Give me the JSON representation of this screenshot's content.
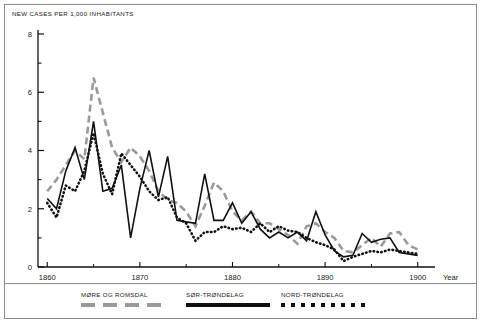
{
  "chart_data": {
    "type": "line",
    "title": "NEW CASES PER 1,000 INHABITANTS",
    "xlabel": "Year",
    "ylabel": "NEW CASES PER 1,000 INHABITANTS",
    "xlim": [
      1859,
      1901
    ],
    "ylim": [
      0,
      8
    ],
    "grid": false,
    "legend_position": "bottom",
    "ytick_labels": [
      "0",
      "2",
      "4",
      "6",
      "8"
    ],
    "ytick_values": [
      0,
      2,
      4,
      6,
      8
    ],
    "yminor_values": [
      1,
      3,
      5,
      7
    ],
    "xtick_labels": [
      "1860",
      "1870",
      "1880",
      "1890",
      "1900"
    ],
    "xtick_values": [
      1860,
      1870,
      1880,
      1890,
      1900
    ],
    "x": [
      1860,
      1861,
      1862,
      1863,
      1864,
      1865,
      1866,
      1867,
      1868,
      1869,
      1870,
      1871,
      1872,
      1873,
      1874,
      1875,
      1876,
      1877,
      1878,
      1879,
      1880,
      1881,
      1882,
      1883,
      1884,
      1885,
      1886,
      1887,
      1888,
      1889,
      1890,
      1891,
      1892,
      1893,
      1894,
      1895,
      1896,
      1897,
      1898,
      1899,
      1900
    ],
    "series": [
      {
        "name": "MØRE OG ROMSDAL",
        "style": "dashed",
        "color": "#9a9a9a",
        "values": [
          2.6,
          3.0,
          3.5,
          4.0,
          3.7,
          6.5,
          5.3,
          4.1,
          3.6,
          4.1,
          3.8,
          3.3,
          2.6,
          2.3,
          2.2,
          1.9,
          1.4,
          2.1,
          2.9,
          2.6,
          1.9,
          1.6,
          1.9,
          1.5,
          1.5,
          1.3,
          1.1,
          0.8,
          1.4,
          1.5,
          1.2,
          1.0,
          0.55,
          0.5,
          0.75,
          1.0,
          0.7,
          1.15,
          1.2,
          0.75,
          0.6
        ]
      },
      {
        "name": "SØR-TRØNDELAG",
        "style": "solid",
        "color": "#111111",
        "values": [
          2.35,
          2.0,
          3.3,
          4.1,
          3.0,
          5.0,
          2.6,
          2.7,
          3.5,
          1.0,
          2.7,
          4.0,
          2.4,
          3.8,
          1.6,
          1.55,
          1.5,
          3.2,
          1.6,
          1.6,
          2.2,
          1.5,
          1.9,
          1.3,
          1.0,
          1.2,
          1.0,
          1.2,
          0.9,
          1.9,
          1.1,
          0.55,
          0.35,
          0.4,
          1.15,
          0.85,
          0.95,
          1.0,
          0.5,
          0.45,
          0.4
        ]
      },
      {
        "name": "NORD-TRØNDELAG",
        "style": "dotted",
        "color": "#111111",
        "values": [
          2.2,
          1.7,
          2.8,
          2.6,
          3.3,
          4.6,
          3.2,
          2.5,
          3.9,
          3.5,
          3.1,
          2.6,
          2.3,
          2.4,
          1.7,
          1.5,
          0.9,
          1.2,
          1.2,
          1.4,
          1.3,
          1.35,
          1.2,
          1.5,
          1.2,
          1.4,
          1.25,
          1.2,
          1.0,
          0.85,
          0.75,
          0.6,
          0.2,
          0.35,
          0.45,
          0.55,
          0.5,
          0.6,
          0.55,
          0.5,
          0.45
        ]
      }
    ]
  },
  "legend": [
    {
      "label": "MØRE OG ROMSDAL",
      "style": "dashed"
    },
    {
      "label": "SØR-TRØNDELAG",
      "style": "solid"
    },
    {
      "label": "NORD-TRØNDELAG",
      "style": "dotted"
    }
  ],
  "colors": {
    "more_og_romsdal": "#9a9a9a",
    "sor_trondelag": "#111111",
    "nord_trondelag": "#111111",
    "axis": "#111111",
    "frame": "#8d8d8d",
    "background": "#ffffff"
  }
}
